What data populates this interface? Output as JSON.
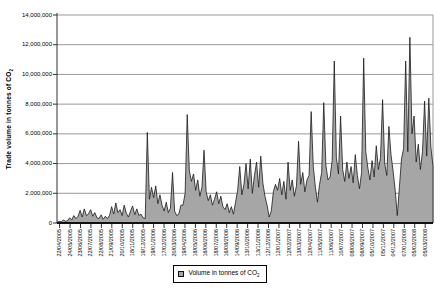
{
  "chart_data": {
    "type": "area",
    "title": "",
    "ylabel_main": "Trade volume in tonnes of CO",
    "ylabel_sub": "2",
    "grid": "horizontal",
    "legend": {
      "position": "bottom-center",
      "label_main": "Volume in tonnes of CO",
      "label_sub": "2"
    },
    "ylim": [
      0,
      14000000
    ],
    "y_ticks": [
      0,
      2000000,
      4000000,
      6000000,
      8000000,
      10000000,
      12000000,
      14000000
    ],
    "y_tick_labels": [
      "0",
      "2,000,000",
      "4,000,000",
      "6,000,000",
      "8,000,000",
      "10,000,000",
      "12,000,000",
      "14,000,000"
    ],
    "x_tick_labels": [
      "22/04/2005",
      "24/05/2005",
      "23/06/2005",
      "22/07/2005",
      "22/08/2005",
      "21/09/2005",
      "20/10/2005",
      "18/11/2005",
      "19/12/2005",
      "19/01/2006",
      "17/02/2006",
      "20/03/2006",
      "19/04/2006",
      "18/05/2006",
      "16/06/2006",
      "18/07/2006",
      "16/08/2006",
      "14/09/2006",
      "13/10/2006",
      "13/11/2006",
      "12/12/2006",
      "12/01/2007",
      "12/02/2007",
      "13/03/2007",
      "12/04/2007",
      "11/05/2007",
      "11/06/2007",
      "10/07/2007",
      "08/08/2007",
      "06/09/2007",
      "05/10/2007",
      "05/11/2007",
      "04/12/2007",
      "07/01/2008",
      "05/02/2008",
      "05/03/2008"
    ],
    "series": [
      {
        "name": "Volume in tonnes of CO2",
        "values_tonnes": [
          50000,
          100000,
          80000,
          200000,
          120000,
          150000,
          350000,
          200000,
          500000,
          300000,
          450000,
          850000,
          400000,
          950000,
          500000,
          600000,
          900000,
          450000,
          700000,
          350000,
          300000,
          550000,
          250000,
          450000,
          300000,
          500000,
          1100000,
          600000,
          1350000,
          700000,
          900000,
          500000,
          1200000,
          650000,
          400000,
          800000,
          1150000,
          550000,
          950000,
          500000,
          600000,
          350000,
          300000,
          6100000,
          1600000,
          2400000,
          1700000,
          2500000,
          1300000,
          1900000,
          1200000,
          800000,
          1400000,
          700000,
          1000000,
          3400000,
          800000,
          500000,
          600000,
          1200000,
          1200000,
          2000000,
          7300000,
          3500000,
          2800000,
          3300000,
          2200000,
          2900000,
          1800000,
          2400000,
          4900000,
          2100000,
          1500000,
          1900000,
          1200000,
          1600000,
          2100000,
          1300000,
          1800000,
          1100000,
          900000,
          1300000,
          700000,
          1100000,
          600000,
          1400000,
          2200000,
          3800000,
          1900000,
          2600000,
          4000000,
          2300000,
          4300000,
          2000000,
          3200000,
          4100000,
          2400000,
          4500000,
          2700000,
          1800000,
          1200000,
          400000,
          800000,
          2100000,
          2600000,
          2200000,
          3000000,
          1900000,
          2800000,
          1600000,
          4100000,
          2200000,
          2900000,
          1800000,
          2500000,
          5500000,
          2600000,
          3400000,
          2100000,
          2900000,
          3200000,
          7500000,
          3800000,
          2400000,
          1400000,
          2600000,
          3400000,
          8100000,
          3900000,
          2900000,
          3100000,
          4200000,
          10900000,
          4400000,
          3300000,
          7200000,
          3600000,
          2800000,
          4100000,
          3000000,
          3800000,
          2700000,
          4600000,
          3200000,
          2300000,
          3400000,
          11100000,
          4800000,
          3700000,
          2900000,
          4200000,
          3100000,
          5200000,
          3600000,
          4400000,
          8300000,
          4000000,
          3200000,
          6500000,
          4600000,
          3500000,
          2200000,
          500000,
          2400000,
          4300000,
          5000000,
          10900000,
          4800000,
          12500000,
          6000000,
          7200000,
          4100000,
          5300000,
          3600000,
          4800000,
          8200000,
          4500000,
          8400000,
          5100000,
          3800000
        ]
      }
    ],
    "colors": {
      "area_fill": "#a6a6a6",
      "area_stroke": "#1a1a1a",
      "gridline": "#999999",
      "axis": "#333333",
      "baseline": "#111111",
      "background": "#ffffff"
    }
  }
}
